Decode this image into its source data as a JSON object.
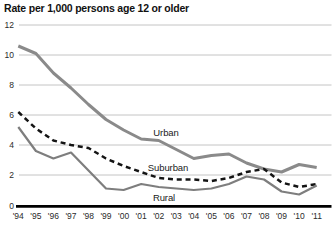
{
  "chart_data": {
    "type": "line",
    "title": "Rate per 1,000 persons age 12 or older",
    "x_labels": [
      "'94",
      "'95",
      "'96",
      "'97",
      "'98",
      "'99",
      "'00",
      "'01",
      "'02",
      "'03",
      "'04",
      "'05",
      "'06",
      "'07",
      "'08",
      "'09",
      "'10",
      "'11"
    ],
    "ylim": [
      0,
      12
    ],
    "yticks": [
      0,
      2,
      4,
      6,
      8,
      10,
      12
    ],
    "grid": true,
    "legend_position": "inline-labels-on-plot",
    "series": [
      {
        "name": "Urban",
        "style": "solid",
        "color": "#8a8a8a",
        "values": [
          10.6,
          10.1,
          8.8,
          7.8,
          6.7,
          5.7,
          5.0,
          4.4,
          4.3,
          3.7,
          3.1,
          3.3,
          3.4,
          2.8,
          2.4,
          2.2,
          2.7,
          2.5
        ]
      },
      {
        "name": "Suburban",
        "style": "dashed",
        "color": "#141414",
        "values": [
          6.2,
          5.1,
          4.3,
          4.0,
          3.8,
          3.1,
          2.6,
          2.2,
          1.8,
          1.7,
          1.7,
          1.6,
          1.8,
          2.2,
          2.4,
          1.5,
          1.2,
          1.4
        ]
      },
      {
        "name": "Rural",
        "style": "solid",
        "color": "#7e7e7e",
        "values": [
          5.2,
          3.6,
          3.1,
          3.5,
          2.3,
          1.1,
          1.0,
          1.4,
          1.2,
          1.1,
          1.0,
          1.1,
          1.4,
          1.9,
          1.7,
          0.9,
          0.7,
          1.3
        ]
      }
    ],
    "axis_colors": {
      "gridline": "#bdbdbd",
      "baseline": "#000000"
    }
  }
}
